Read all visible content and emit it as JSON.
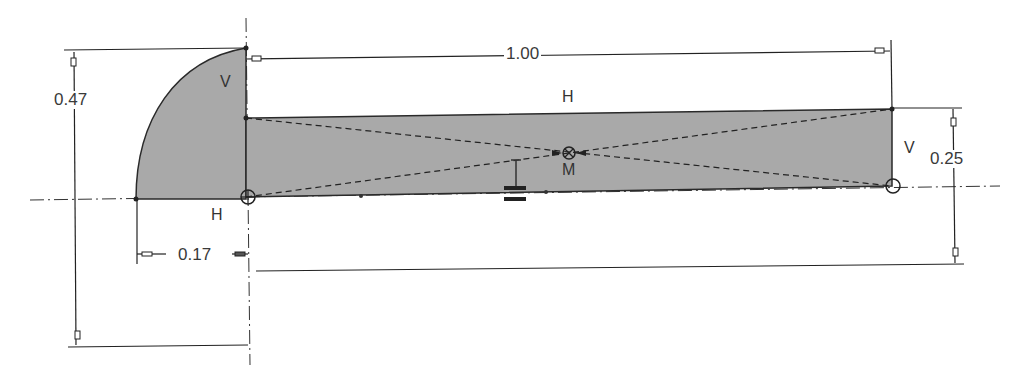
{
  "sketch": {
    "fill_color": "#a9a9a9",
    "line_color": "#2a2a2a",
    "dimensions": {
      "total_height": "0.47",
      "length": "1.00",
      "bar_height": "0.25",
      "offset": "0.17"
    },
    "constraints": {
      "arc_vertical": "V",
      "top_horizontal": "H",
      "bottom_horizontal": "H",
      "right_vertical": "V",
      "midpoint": "M"
    }
  }
}
